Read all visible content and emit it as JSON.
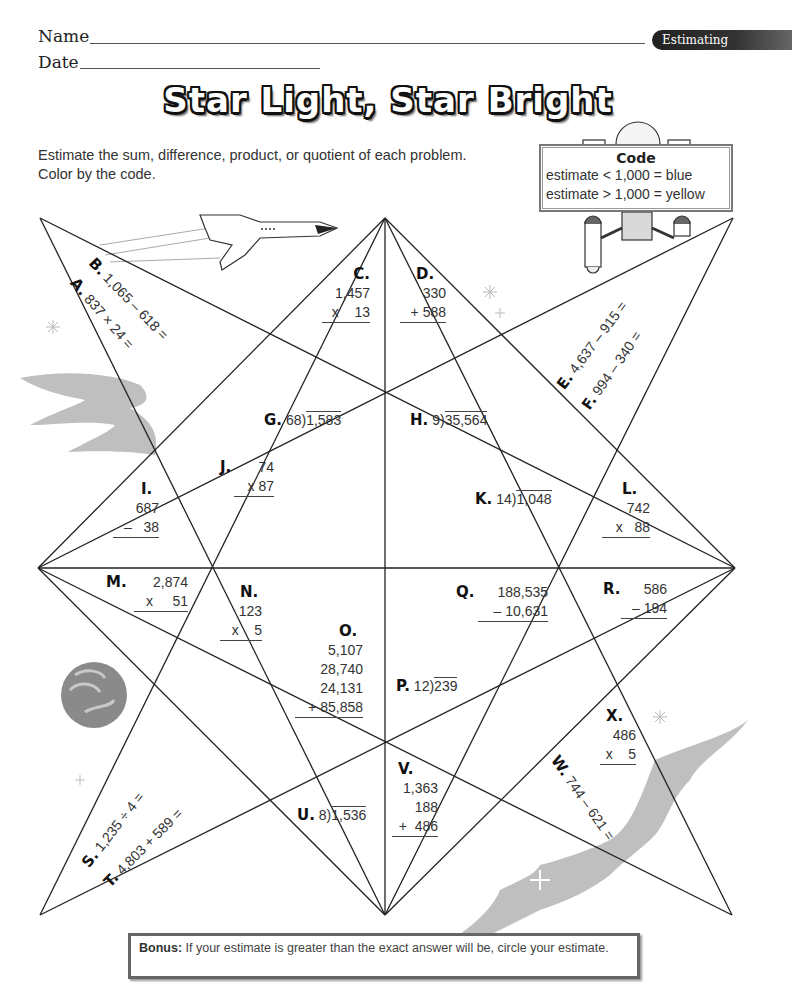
{
  "header": {
    "name_label": "Name",
    "date_label": "Date",
    "topic_tab": "Estimating"
  },
  "title": "Star Light, Star Bright",
  "instructions": {
    "line1": "Estimate the sum, difference, product, or quotient of each problem.",
    "line2": "Color by the code."
  },
  "code_box": {
    "title": "Code",
    "rule1": "estimate < 1,000 = blue",
    "rule2": "estimate > 1,000 = yellow"
  },
  "colors": {
    "blue_code": "blue",
    "yellow_code": "yellow",
    "line": "#222222",
    "decoration_gray": "#bdbdbd"
  },
  "problems": {
    "A": {
      "label": "A.",
      "expr": "837 × 24 ="
    },
    "B": {
      "label": "B.",
      "expr": "1,065 – 618 ="
    },
    "C": {
      "label": "C.",
      "top": "1,457",
      "bottom": "x    13"
    },
    "D": {
      "label": "D.",
      "top": "330",
      "bottom": "+ 588"
    },
    "E": {
      "label": "E.",
      "expr": "4,637 – 915 ="
    },
    "F": {
      "label": "F.",
      "expr": "994 – 340 ="
    },
    "G": {
      "label": "G.",
      "divisor": "68",
      "dividend": "1,583"
    },
    "H": {
      "label": "H.",
      "divisor": "9",
      "dividend": "35,564"
    },
    "I": {
      "label": "I.",
      "top": "687",
      "bottom": "–   38"
    },
    "J": {
      "label": "J.",
      "top": "74",
      "bottom": "x 87"
    },
    "K": {
      "label": "K.",
      "divisor": "14",
      "dividend": "1,048"
    },
    "L": {
      "label": "L.",
      "top": "742",
      "bottom": "x   88"
    },
    "M": {
      "label": "M.",
      "top": "2,874",
      "bottom": "x     51"
    },
    "N": {
      "label": "N.",
      "top": "123",
      "bottom": "x    5"
    },
    "O": {
      "label": "O.",
      "lines": [
        "5,107",
        "28,740",
        "24,131"
      ],
      "bottom": "+ 85,858"
    },
    "P": {
      "label": "P.",
      "divisor": "12",
      "dividend": "239"
    },
    "Q": {
      "label": "Q.",
      "top": "188,535",
      "bottom": "– 10,631"
    },
    "R": {
      "label": "R.",
      "top": "586",
      "bottom": "– 194"
    },
    "S": {
      "label": "S.",
      "expr": "1,235 ÷ 4 ="
    },
    "T": {
      "label": "T.",
      "expr": "4,803 + 589 ="
    },
    "U": {
      "label": "U.",
      "divisor": "8",
      "dividend": "1,536"
    },
    "V": {
      "label": "V.",
      "lines": [
        "1,363",
        "188"
      ],
      "bottom": "+  486"
    },
    "W": {
      "label": "W.",
      "expr": "744 – 621 ="
    },
    "X": {
      "label": "X.",
      "top": "486",
      "bottom": "x    5"
    }
  },
  "bonus": {
    "label": "Bonus:",
    "text": "If your estimate is greater than the exact answer will be, circle your estimate."
  },
  "decorations": [
    "space-shuttle-icon",
    "robot-satellite-icon",
    "planet-icon",
    "comet-cloud-icon",
    "sparkle-star-icon"
  ]
}
